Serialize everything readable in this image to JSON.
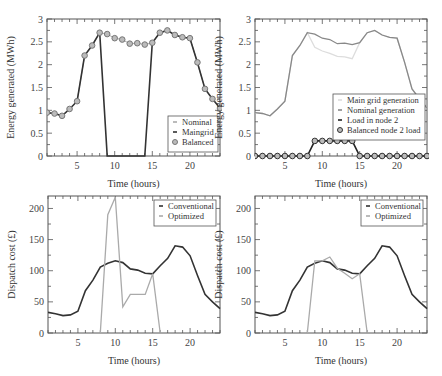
{
  "chart_data": [
    {
      "id": "top-left",
      "type": "line",
      "title": "",
      "xlabel": "Time (hours)",
      "ylabel": "Energy generated (MWh)",
      "xlim": [
        1,
        24
      ],
      "ylim": [
        0,
        3
      ],
      "xticks": [
        5,
        10,
        15,
        20
      ],
      "yticks": [
        0,
        0.5,
        1,
        1.5,
        2,
        2.5,
        3
      ],
      "ytick_labels": [
        "0",
        "0.5",
        "1",
        "1.5",
        "2",
        "2.5",
        "3"
      ],
      "grid": false,
      "legend_position": "lower right",
      "x": [
        1,
        2,
        3,
        4,
        5,
        6,
        7,
        8,
        9,
        10,
        11,
        12,
        13,
        14,
        15,
        16,
        17,
        18,
        19,
        20,
        21,
        22,
        23,
        24
      ],
      "series": [
        {
          "name": "Nominal",
          "style": "light-marker",
          "color": "#aaaaaa",
          "values": [
            0.95,
            0.93,
            0.88,
            1.03,
            1.2,
            2.2,
            2.42,
            2.7,
            2.67,
            2.58,
            2.55,
            2.46,
            2.47,
            2.44,
            2.48,
            2.7,
            2.75,
            2.65,
            2.6,
            2.58,
            2.05,
            1.47,
            1.25,
            1.05
          ]
        },
        {
          "name": "Maingrid",
          "style": "line",
          "color": "#333333",
          "values": [
            0.95,
            0.93,
            0.88,
            1.03,
            1.2,
            2.2,
            2.42,
            2.7,
            0,
            0,
            0,
            0,
            0,
            0,
            2.48,
            2.7,
            2.75,
            2.65,
            2.6,
            2.58,
            2.05,
            1.47,
            1.25,
            1.05
          ]
        },
        {
          "name": "Balanced",
          "style": "circle",
          "color": "#777777",
          "values": [
            0.95,
            0.93,
            0.88,
            1.03,
            1.2,
            2.2,
            2.42,
            2.7,
            2.67,
            2.58,
            2.55,
            2.46,
            2.47,
            2.44,
            2.48,
            2.7,
            2.75,
            2.65,
            2.6,
            2.58,
            2.05,
            1.47,
            1.25,
            1.05
          ]
        }
      ]
    },
    {
      "id": "top-right",
      "type": "line",
      "title": "",
      "xlabel": "Time (hours)",
      "ylabel": "Energy generated (MWh)",
      "xlim": [
        1,
        24
      ],
      "ylim": [
        0,
        3
      ],
      "xticks": [
        5,
        10,
        15,
        20
      ],
      "yticks": [
        0,
        0.5,
        1,
        1.5,
        2,
        2.5,
        3
      ],
      "ytick_labels": [
        "0",
        "0.5",
        "1",
        "1.5",
        "2",
        "2.5",
        "3"
      ],
      "grid": false,
      "legend_position": "lower right",
      "x": [
        1,
        2,
        3,
        4,
        5,
        6,
        7,
        8,
        9,
        10,
        11,
        12,
        13,
        14,
        15,
        16,
        17,
        18,
        19,
        20,
        21,
        22,
        23,
        24
      ],
      "series": [
        {
          "name": "Main grid generation",
          "style": "line",
          "color": "#dddddd",
          "values": [
            0.95,
            0.93,
            0.88,
            1.03,
            1.2,
            2.2,
            2.42,
            2.7,
            2.38,
            2.3,
            2.25,
            2.18,
            2.17,
            2.13,
            2.48,
            2.7,
            2.75,
            2.65,
            2.6,
            2.58,
            2.05,
            1.47,
            1.25,
            1.05
          ]
        },
        {
          "name": "Nominal generation",
          "style": "line",
          "color": "#888888",
          "values": [
            0.95,
            0.93,
            0.88,
            1.03,
            1.2,
            2.2,
            2.42,
            2.7,
            2.67,
            2.58,
            2.55,
            2.46,
            2.47,
            2.44,
            2.48,
            2.7,
            2.75,
            2.65,
            2.6,
            2.58,
            2.05,
            1.47,
            1.25,
            1.05
          ]
        },
        {
          "name": "Load in node 2",
          "style": "line",
          "color": "#222222",
          "values": [
            0,
            0,
            0,
            0,
            0,
            0,
            0,
            0,
            0.33,
            0.33,
            0.33,
            0.33,
            0.33,
            0.33,
            0,
            0,
            0,
            0,
            0,
            0,
            0,
            0,
            0,
            0
          ]
        },
        {
          "name": "Balanced node 2 load",
          "style": "circle",
          "color": "#333333",
          "values": [
            0,
            0,
            0,
            0,
            0,
            0,
            0,
            0,
            0.33,
            0.33,
            0.33,
            0.33,
            0.33,
            0.33,
            0,
            0,
            0,
            0,
            0,
            0,
            0,
            0,
            0,
            0
          ]
        }
      ]
    },
    {
      "id": "bottom-left",
      "type": "line",
      "title": "",
      "xlabel": "Time (hours)",
      "ylabel": "Dispatch cost (£)",
      "xlim": [
        1,
        24
      ],
      "ylim": [
        0,
        220
      ],
      "xticks": [
        5,
        10,
        15,
        20
      ],
      "yticks": [
        0,
        50,
        100,
        150,
        200
      ],
      "ytick_labels": [
        "0",
        "50",
        "100",
        "150",
        "200"
      ],
      "grid": false,
      "legend_position": "upper right",
      "x": [
        1,
        2,
        3,
        4,
        5,
        6,
        7,
        8,
        9,
        10,
        11,
        12,
        13,
        14,
        15,
        16,
        17,
        18,
        19,
        20,
        21,
        22,
        23,
        24
      ],
      "series": [
        {
          "name": "Conventional",
          "style": "line",
          "color": "#333333",
          "values": [
            33,
            31,
            28,
            29,
            35,
            68,
            85,
            106,
            112,
            116,
            113,
            103,
            101,
            96,
            95,
            108,
            120,
            140,
            138,
            124,
            92,
            62,
            50,
            39
          ]
        },
        {
          "name": "Optimized",
          "style": "line",
          "color": "#aaaaaa",
          "x": [
            8,
            9,
            10,
            11,
            12,
            13,
            14,
            15,
            16
          ],
          "values": [
            0,
            190,
            218,
            42,
            62,
            62,
            62,
            95,
            0
          ]
        }
      ]
    },
    {
      "id": "bottom-right",
      "type": "line",
      "title": "",
      "xlabel": "Time (hours)",
      "ylabel": "Dispatch cost (£)",
      "xlim": [
        1,
        24
      ],
      "ylim": [
        0,
        220
      ],
      "xticks": [
        5,
        10,
        15,
        20
      ],
      "yticks": [
        0,
        50,
        100,
        150,
        200
      ],
      "ytick_labels": [
        "0",
        "50",
        "100",
        "150",
        "200"
      ],
      "grid": false,
      "legend_position": "upper right",
      "x": [
        1,
        2,
        3,
        4,
        5,
        6,
        7,
        8,
        9,
        10,
        11,
        12,
        13,
        14,
        15,
        16,
        17,
        18,
        19,
        20,
        21,
        22,
        23,
        24
      ],
      "series": [
        {
          "name": "Conventional",
          "style": "line",
          "color": "#333333",
          "values": [
            33,
            31,
            28,
            29,
            35,
            68,
            85,
            106,
            112,
            116,
            113,
            103,
            101,
            96,
            95,
            108,
            120,
            140,
            138,
            124,
            92,
            62,
            50,
            39
          ]
        },
        {
          "name": "Optimized",
          "style": "line",
          "color": "#aaaaaa",
          "x": [
            8,
            9,
            10,
            11,
            12,
            13,
            14,
            15,
            16
          ],
          "values": [
            0,
            116,
            116,
            122,
            104,
            96,
            87,
            95,
            0
          ]
        }
      ]
    }
  ],
  "layout": {
    "panels": [
      {
        "left": 47,
        "top": 19,
        "right": 220,
        "bottom": 156
      },
      {
        "left": 255,
        "top": 19,
        "right": 427,
        "bottom": 156
      },
      {
        "left": 48,
        "top": 196,
        "right": 220,
        "bottom": 333
      },
      {
        "left": 255,
        "top": 196,
        "right": 427,
        "bottom": 333
      }
    ]
  }
}
